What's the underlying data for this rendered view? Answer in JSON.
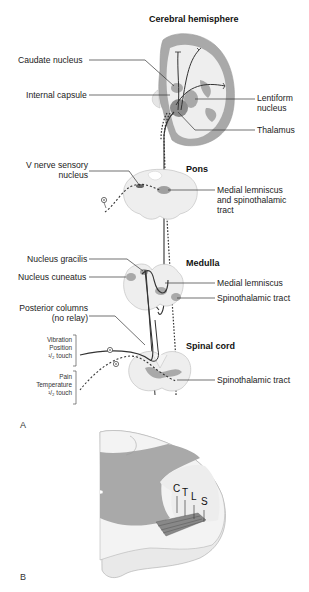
{
  "panel_a": {
    "label": "A",
    "titles": {
      "cerebral_hemisphere": "Cerebral hemisphere",
      "pons": "Pons",
      "medulla": "Medulla",
      "spinal_cord": "Spinal cord"
    },
    "left_labels": {
      "caudate_nucleus": "Caudate nucleus",
      "internal_capsule": "Internal capsule",
      "v_nerve_line1": "V nerve sensory",
      "v_nerve_line2": "nucleus",
      "nucleus_gracilis": "Nucleus gracilis",
      "nucleus_cuneatus": "Nucleus cuneatus",
      "posterior_columns_line1": "Posterior columns",
      "posterior_columns_line2": "(no relay)"
    },
    "right_labels": {
      "lentiform_line1": "Lentiform",
      "lentiform_line2": "nucleus",
      "thalamus": "Thalamus",
      "ml_st_line1": "Medial lemniscus",
      "ml_st_line2": "and spinothalamic",
      "ml_st_line3": "tract",
      "medial_lemniscus": "Medial lemniscus",
      "spinothalamic_medulla": "Spinothalamic tract",
      "spinothalamic_cord": "Spinothalamic tract"
    },
    "modalities": {
      "group1": [
        "Vibration",
        "Position",
        "¹/₂ touch"
      ],
      "group2": [
        "Pain",
        "Temperature",
        "¹/₂ touch"
      ]
    }
  },
  "panel_b": {
    "label": "B",
    "segments": [
      "C",
      "T",
      "L",
      "S"
    ]
  },
  "colors": {
    "grey_matter": "#a9a9a9",
    "white_matter": "#eeeeee",
    "outline": "#888888",
    "pathway": "#333333"
  }
}
